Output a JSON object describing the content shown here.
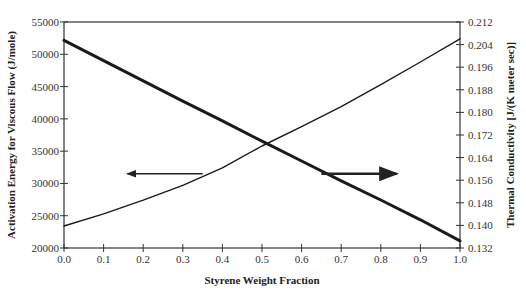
{
  "chart_data": {
    "type": "line",
    "title": "",
    "xlabel": "Styrene Weight Fraction",
    "ylabel": "Activation Energy for Viscous Flow (J/mole)",
    "y2label": "Thermal Conductivity [J/(K meter sec)]",
    "xlim": [
      0.0,
      1.0
    ],
    "ylim": [
      20000,
      55000
    ],
    "y2lim": [
      0.132,
      0.212
    ],
    "x_ticks": [
      "0.0",
      "0.1",
      "0.2",
      "0.3",
      "0.4",
      "0.5",
      "0.6",
      "0.7",
      "0.8",
      "0.9",
      "1.0"
    ],
    "y_ticks": [
      "20000",
      "25000",
      "30000",
      "35000",
      "40000",
      "45000",
      "50000",
      "55000"
    ],
    "y2_ticks": [
      "0.132",
      "0.140",
      "0.148",
      "0.156",
      "0.164",
      "0.172",
      "0.180",
      "0.188",
      "0.196",
      "0.204",
      "0.212"
    ],
    "grid": false,
    "x": [
      0.0,
      0.1,
      0.2,
      0.3,
      0.4,
      0.5,
      0.6,
      0.7,
      0.8,
      0.9,
      1.0
    ],
    "series": [
      {
        "name": "Activation Energy for Viscous Flow",
        "axis": "left",
        "style": "thin",
        "values": [
          23400,
          25300,
          27400,
          29700,
          32400,
          35800,
          38800,
          41900,
          45300,
          48800,
          52400
        ]
      },
      {
        "name": "Thermal Conductivity",
        "axis": "right",
        "style": "thick",
        "values": [
          0.2055,
          0.1983,
          0.1912,
          0.184,
          0.177,
          0.1698,
          0.1628,
          0.1558,
          0.149,
          0.142,
          0.1345
        ]
      }
    ],
    "annotations": [
      {
        "type": "arrow",
        "direction": "left",
        "from_x": 0.35,
        "to_x": 0.16,
        "y": 31500,
        "meaning": "thin curve reads on left axis"
      },
      {
        "type": "arrow",
        "direction": "right",
        "from_x": 0.65,
        "to_x": 0.84,
        "y": 31500,
        "meaning": "thick curve reads on right axis"
      }
    ]
  }
}
